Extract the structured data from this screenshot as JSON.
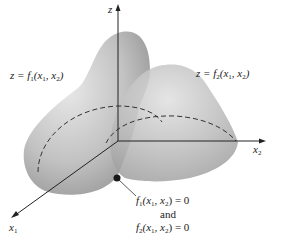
{
  "diagram": {
    "type": "3d-surfaces-intersection",
    "axes": {
      "z": "z",
      "x1": "x",
      "x1_sub": "1",
      "x2": "x",
      "x2_sub": "2"
    },
    "surface1_label": {
      "prefix": "z = ",
      "func": "f",
      "func_sub": "1",
      "args": "(x",
      "arg1_sub": "1",
      "sep": ", x",
      "arg2_sub": "2",
      "close": ")"
    },
    "surface2_label": {
      "prefix": "z = ",
      "func": "f",
      "func_sub": "2",
      "args": "(x",
      "arg1_sub": "1",
      "sep": ", x",
      "arg2_sub": "2",
      "close": ")"
    },
    "point_annotation": {
      "line1_func": "f",
      "line1_sub": "1",
      "line1_args": "(x",
      "line1_a1": "1",
      "line1_sep": ", x",
      "line1_a2": "2",
      "line1_end": ") = 0",
      "connector": "and",
      "line3_func": "f",
      "line3_sub": "2",
      "line3_args": "(x",
      "line3_a1": "1",
      "line3_sep": ", x",
      "line3_a2": "2",
      "line3_end": ") = 0"
    },
    "colors": {
      "surface": "#a8a8a8",
      "surface_light": "#e2e2e2",
      "axis": "#222222",
      "point": "#1a1a1a"
    }
  }
}
